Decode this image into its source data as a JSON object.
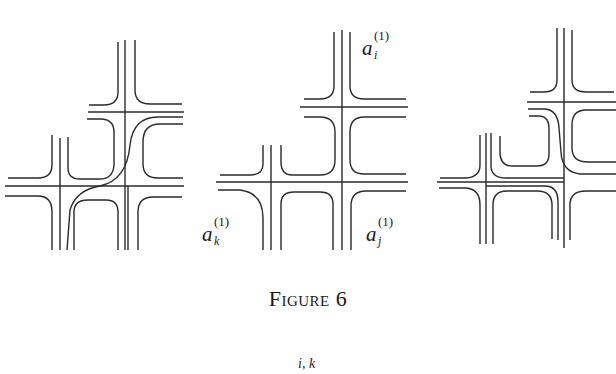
{
  "figure": {
    "caption": "Figure 6",
    "panels": [
      {
        "id": "left",
        "description": "Two crossings with strands resolved; one strand passes diagonally through the middle"
      },
      {
        "id": "middle",
        "description": "Two crossings with labeled corner regions",
        "labels": [
          "a_i^(1)",
          "a_k^(1)",
          "a_j^(1)"
        ]
      },
      {
        "id": "right",
        "description": "Two crossings with an alternative strand resolution"
      }
    ]
  },
  "labels": {
    "a_i": {
      "base": "a",
      "sup": "(1)",
      "sub": "i"
    },
    "a_k": {
      "base": "a",
      "sup": "(1)",
      "sub": "k"
    },
    "a_j": {
      "base": "a",
      "sup": "(1)",
      "sub": "j"
    }
  },
  "next_formula_fragment": "i, k",
  "colors": {
    "stroke": "#2a2a2a",
    "background": "#ffffff",
    "text": "#1a1a1a"
  }
}
